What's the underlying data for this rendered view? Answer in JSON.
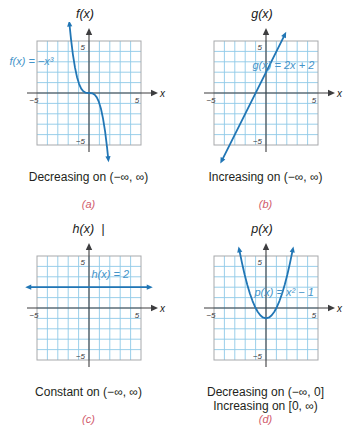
{
  "colors": {
    "curve": "#2176b5",
    "grid": "#8fc9e8",
    "grid_border": "#a7a9ac",
    "axis": "#3d3d3f",
    "equation": "#4494c9",
    "caption": "#231f20",
    "letter": "#d15a6b"
  },
  "chart_data": [
    {
      "id": "a",
      "type": "line",
      "title": "f(x)",
      "x_axis_label": "x",
      "equation_label": "f(x) = −x³",
      "function": "f(x) = -x^3",
      "x_range": [
        -5,
        5
      ],
      "y_range": [
        -5,
        5
      ],
      "grid": true,
      "arrows": "both",
      "ticks": {
        "x_min": "−5",
        "x_max": "5",
        "y_max": "5",
        "y_min": "−5"
      },
      "points": [
        [
          -1.87,
          6.54
        ],
        [
          -1.73,
          5.18
        ],
        [
          -1.55,
          3.72
        ],
        [
          -1.35,
          2.46
        ],
        [
          -1.15,
          1.52
        ],
        [
          -0.95,
          0.86
        ],
        [
          -0.75,
          0.42
        ],
        [
          -0.55,
          0.17
        ],
        [
          -0.35,
          0.04
        ],
        [
          0,
          0
        ],
        [
          0.35,
          -0.04
        ],
        [
          0.55,
          -0.17
        ],
        [
          0.75,
          -0.42
        ],
        [
          0.95,
          -0.86
        ],
        [
          1.15,
          -1.52
        ],
        [
          1.35,
          -2.46
        ],
        [
          1.55,
          -3.72
        ],
        [
          1.73,
          -5.18
        ],
        [
          1.84,
          -6.23
        ]
      ],
      "captions": [
        "Decreasing on (−∞, ∞)"
      ],
      "letter": "(a)"
    },
    {
      "id": "b",
      "type": "line",
      "title": "g(x)",
      "x_axis_label": "x",
      "equation_label": "g(x) = 2x + 2",
      "function": "g(x) = 2x + 2",
      "x_range": [
        -5,
        5
      ],
      "y_range": [
        -5,
        5
      ],
      "grid": true,
      "arrows": "both",
      "ticks": {
        "x_min": "−5",
        "x_max": "5",
        "y_max": "5",
        "y_min": "−5"
      },
      "points": [
        [
          -4.2,
          -6.4
        ],
        [
          1.75,
          5.5
        ]
      ],
      "captions": [
        "Increasing on (−∞, ∞)"
      ],
      "letter": "(b)"
    },
    {
      "id": "c",
      "type": "line",
      "title": "h(x)",
      "stray_mark": "|",
      "x_axis_label": "x",
      "equation_label": "h(x) = 2",
      "function": "h(x) = 2",
      "x_range": [
        -5,
        5
      ],
      "y_range": [
        -5,
        5
      ],
      "grid": true,
      "arrows": "both",
      "ticks": {
        "x_min": "−5",
        "x_max": "5",
        "y_max": "5",
        "y_min": "−5"
      },
      "points": [
        [
          -5.7,
          2
        ],
        [
          5.7,
          2
        ]
      ],
      "captions": [
        "Constant on (−∞, ∞)"
      ],
      "letter": "(c)"
    },
    {
      "id": "d",
      "type": "line",
      "title": "p(x)",
      "x_axis_label": "x",
      "equation_label": "p(x) = x² − 1",
      "function": "p(x) = x^2 - 1",
      "x_range": [
        -5,
        5
      ],
      "y_range": [
        -5,
        5
      ],
      "grid": true,
      "arrows": "both",
      "ticks": {
        "x_min": "−5",
        "x_max": "5",
        "y_max": "5",
        "y_min": "−5"
      },
      "points": [
        [
          -2.55,
          5.5
        ],
        [
          -2.3,
          4.29
        ],
        [
          -2.05,
          3.2
        ],
        [
          -1.8,
          2.24
        ],
        [
          -1.55,
          1.4
        ],
        [
          -1.3,
          0.69
        ],
        [
          -1.05,
          0.1
        ],
        [
          -0.8,
          -0.36
        ],
        [
          -0.55,
          -0.7
        ],
        [
          -0.3,
          -0.91
        ],
        [
          0,
          -1
        ],
        [
          0.3,
          -0.91
        ],
        [
          0.55,
          -0.7
        ],
        [
          0.8,
          -0.36
        ],
        [
          1.05,
          0.1
        ],
        [
          1.3,
          0.69
        ],
        [
          1.55,
          1.4
        ],
        [
          1.8,
          2.24
        ],
        [
          2.05,
          3.2
        ],
        [
          2.3,
          4.29
        ],
        [
          2.55,
          5.5
        ]
      ],
      "captions": [
        "Decreasing on (−∞, 0]",
        "Increasing on [0, ∞)"
      ],
      "letter": "(d)"
    }
  ]
}
